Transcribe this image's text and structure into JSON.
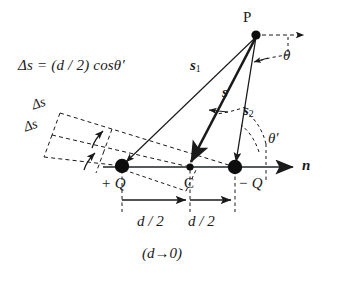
{
  "figure": {
    "type": "physics-diagram",
    "background_color": "#ffffff",
    "ink_color": "#1a1a1a"
  },
  "labels": {
    "formula": "Δs = (d / 2) cosθ′",
    "delta_s_upper": "Δs",
    "delta_s_lower": "Δs",
    "point_p": "P",
    "theta": "θ",
    "theta_prime": "θ′",
    "s1": "s",
    "s1_sub": "1",
    "s": "s",
    "s2": "s",
    "s2_sub": "2",
    "normal": "n",
    "positive_charge": "+ Q",
    "center": "C",
    "negative_charge": "− Q",
    "half_d_left": "d / 2",
    "half_d_right": "d / 2",
    "limit": "(d→0)"
  },
  "geometry": {
    "point_p": {
      "x": 256,
      "y": 35
    },
    "charge_positive": {
      "x": 122,
      "y": 166
    },
    "charge_center": {
      "x": 190,
      "y": 167
    },
    "charge_negative": {
      "x": 235,
      "y": 167
    },
    "axis_start_x": 103,
    "axis_end_x": 295,
    "axis_y": 167,
    "dashed_ray_end_x": 308,
    "dashed_ray_y": 35,
    "dim_line_y": 200,
    "dim_drop_y": 212
  }
}
